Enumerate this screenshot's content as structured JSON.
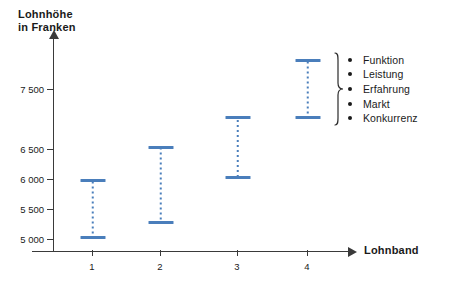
{
  "chart_data": {
    "type": "bar",
    "chart_subtype": "floating-range-bar",
    "title": "",
    "ylabel": "Lohnhöhe\nin Franken",
    "ylabel_lines": [
      "Lohnhöhe",
      "in Franken"
    ],
    "xlabel": "Lohnband",
    "categories": [
      "1",
      "2",
      "3",
      "4"
    ],
    "series": [
      {
        "name": "Minimum",
        "values": [
          5000,
          5250,
          6000,
          7000
        ]
      },
      {
        "name": "Maximum",
        "values": [
          6000,
          6450,
          7050,
          8000
        ]
      }
    ],
    "ranges": [
      {
        "category": "1",
        "min": 5000,
        "max": 6000
      },
      {
        "category": "2",
        "min": 5250,
        "max": 6450
      },
      {
        "category": "3",
        "min": 6000,
        "max": 7050
      },
      {
        "category": "4",
        "min": 7000,
        "max": 8000
      }
    ],
    "ytick_labels": [
      "7 500",
      "6 500",
      "6 000",
      "5 500",
      "5 000"
    ],
    "ytick_values": [
      7500,
      6500,
      6000,
      5500,
      5000
    ],
    "xtick_labels": [
      "1",
      "2",
      "3",
      "4"
    ],
    "ylim": [
      4750,
      8150
    ],
    "grid": false,
    "legend_position": "right",
    "legend_entries": [
      "Funktion",
      "Leistung",
      "Erfahrung",
      "Markt",
      "Konkurrenz"
    ],
    "bar_color": "#4a7ebb",
    "axis_color": "#3a3a3a"
  },
  "axes": {
    "y_title_line1": "Lohnhöhe",
    "y_title_line2": "in Franken",
    "x_title": "Lohnband",
    "y_ticks": [
      {
        "label": "7 500",
        "value": 7500,
        "y": 89
      },
      {
        "label": "6 500",
        "value": 6500,
        "y": 149
      },
      {
        "label": "6 000",
        "value": 6000,
        "y": 179
      },
      {
        "label": "5 500",
        "value": 5500,
        "y": 209
      },
      {
        "label": "5 000",
        "value": 5000,
        "y": 239
      }
    ],
    "x_ticks": [
      {
        "label": "1",
        "x": 92
      },
      {
        "label": "2",
        "x": 160
      },
      {
        "label": "3",
        "x": 237
      },
      {
        "label": "4",
        "x": 307
      }
    ]
  },
  "bars": [
    {
      "category": "1",
      "left": 80,
      "width": 25,
      "top": 179,
      "height": 60,
      "min": 5000,
      "max": 6000
    },
    {
      "category": "2",
      "left": 148,
      "width": 25,
      "top": 146,
      "height": 78,
      "min": 5250,
      "max": 6450
    },
    {
      "category": "3",
      "left": 225,
      "width": 25,
      "top": 116,
      "height": 63,
      "min": 6000,
      "max": 7050
    },
    {
      "category": "4",
      "left": 295,
      "width": 25,
      "top": 59,
      "height": 60,
      "min": 7000,
      "max": 8000
    }
  ],
  "legend": {
    "items": [
      {
        "label": "Funktion"
      },
      {
        "label": "Leistung"
      },
      {
        "label": "Erfahrung"
      },
      {
        "label": "Markt"
      },
      {
        "label": "Konkurrenz"
      }
    ]
  }
}
